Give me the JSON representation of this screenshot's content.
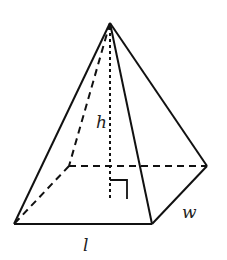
{
  "diagram": {
    "labels": {
      "height": "h",
      "width": "w",
      "length": "l"
    },
    "colors": {
      "stroke": "#111111",
      "background": "#ffffff"
    },
    "vertices": {
      "apex": [
        110,
        23
      ],
      "front_left": [
        14,
        224
      ],
      "front_right": [
        152,
        224
      ],
      "back_right": [
        207,
        166
      ],
      "back_left": [
        69,
        166
      ],
      "height_foot": [
        110,
        166
      ]
    }
  }
}
